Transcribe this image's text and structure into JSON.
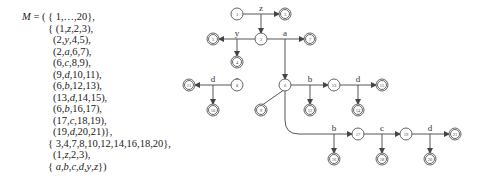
{
  "machine": {
    "lines": [
      {
        "text": "M = ( { 1,…,20},",
        "x": 22,
        "y": 17
      },
      {
        "text": "{ (1,z,2,3),",
        "x": 48,
        "y": 29
      },
      {
        "text": "(2,y,4,5),",
        "x": 53,
        "y": 40
      },
      {
        "text": "(2,a,6,7),",
        "x": 53,
        "y": 52
      },
      {
        "text": "(6,c,8,9),",
        "x": 53,
        "y": 63
      },
      {
        "text": "(9,d,10,11),",
        "x": 53,
        "y": 75
      },
      {
        "text": "(6,b,12,13),",
        "x": 53,
        "y": 86
      },
      {
        "text": "(13,d,14,15),",
        "x": 53,
        "y": 98
      },
      {
        "text": "(6,b,16,17),",
        "x": 53,
        "y": 109
      },
      {
        "text": "(17,c,18,19),",
        "x": 53,
        "y": 121
      },
      {
        "text": "(19,d,20,21)},",
        "x": 53,
        "y": 132
      },
      {
        "text": "{ 3,4,7,8,10,12,14,16,18,20},",
        "x": 48,
        "y": 144
      },
      {
        "text": "(1,z,2,3),",
        "x": 53,
        "y": 155
      },
      {
        "text": "{ a,b,c,d,y,z})",
        "x": 48,
        "y": 167
      }
    ]
  },
  "graph": {
    "nodes": [
      {
        "id": "1",
        "x": 237,
        "y": 14,
        "final": false
      },
      {
        "id": "3",
        "x": 285,
        "y": 14,
        "final": true
      },
      {
        "id": "2",
        "x": 261,
        "y": 39,
        "final": false
      },
      {
        "id": "5",
        "x": 213,
        "y": 39,
        "final": true
      },
      {
        "id": "7",
        "x": 310,
        "y": 39,
        "final": true
      },
      {
        "id": "4",
        "x": 237,
        "y": 62,
        "final": true
      },
      {
        "id": "6",
        "x": 285,
        "y": 85,
        "final": false
      },
      {
        "id": "8",
        "x": 237,
        "y": 85,
        "final": false
      },
      {
        "id": "11",
        "x": 189,
        "y": 85,
        "final": true
      },
      {
        "id": "10",
        "x": 213,
        "y": 110,
        "final": true
      },
      {
        "id": "9",
        "x": 261,
        "y": 110,
        "final": true
      },
      {
        "id": "13",
        "x": 334,
        "y": 85,
        "final": false
      },
      {
        "id": "12",
        "x": 310,
        "y": 110,
        "final": true
      },
      {
        "id": "15",
        "x": 382,
        "y": 85,
        "final": true
      },
      {
        "id": "14",
        "x": 358,
        "y": 110,
        "final": true
      },
      {
        "id": "17",
        "x": 358,
        "y": 134,
        "final": false
      },
      {
        "id": "16",
        "x": 334,
        "y": 159,
        "final": true
      },
      {
        "id": "19",
        "x": 406,
        "y": 134,
        "final": false
      },
      {
        "id": "18",
        "x": 382,
        "y": 159,
        "final": true
      },
      {
        "id": "21",
        "x": 455,
        "y": 134,
        "final": true
      },
      {
        "id": "20",
        "x": 430,
        "y": 159,
        "final": true
      }
    ],
    "hyperedges": [
      {
        "from": "1",
        "label": "z",
        "to1": "2",
        "to2": "3"
      },
      {
        "from": "2",
        "label": "y",
        "to1": "4",
        "to2": "5"
      },
      {
        "from": "2",
        "label": "a",
        "to1": "6",
        "to2": "7"
      },
      {
        "from": "6",
        "label": "c",
        "to1": "8",
        "to2": "9"
      },
      {
        "from": "8",
        "label": "d",
        "to1": "10",
        "to2": "11"
      },
      {
        "from": "6",
        "label": "b",
        "to1": "12",
        "to2": "13"
      },
      {
        "from": "13",
        "label": "d",
        "to1": "14",
        "to2": "15"
      },
      {
        "from": "6",
        "label": "b",
        "to1": "16",
        "to2": "17"
      },
      {
        "from": "17",
        "label": "c",
        "to1": "18",
        "to2": "19"
      },
      {
        "from": "19",
        "label": "d",
        "to1": "20",
        "to2": "21"
      }
    ]
  }
}
